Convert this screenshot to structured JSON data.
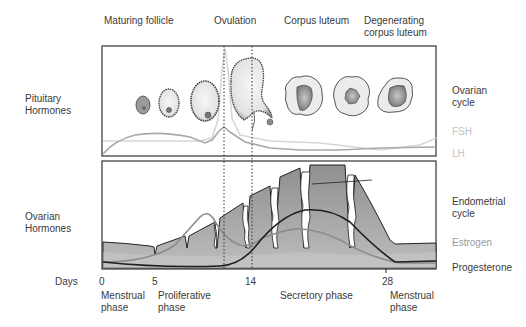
{
  "top_labels": {
    "maturing_follicle": "Maturing follicle",
    "ovulation": "Ovulation",
    "corpus_luteum": "Corpus luteum",
    "degenerating_line1": "Degenerating",
    "degenerating_line2": "corpus luteum"
  },
  "left_labels": {
    "pituitary_line1": "Pituitary",
    "pituitary_line2": "Hormones",
    "ovarian_line1": "Ovarian",
    "ovarian_line2": "Hormones",
    "days": "Days"
  },
  "right_labels": {
    "ovarian_cycle_line1": "Ovarian",
    "ovarian_cycle_line2": "cycle",
    "fsh": "FSH",
    "lh": "LH",
    "endometrial_line1": "Endometrial",
    "endometrial_line2": "cycle",
    "estrogen": "Estrogen",
    "progesterone": "Progesterone"
  },
  "annotation": {
    "uterine_line1": "Uterine",
    "uterine_line2": "gland"
  },
  "day_ticks": [
    "0",
    "5",
    "14",
    "28"
  ],
  "phases": {
    "menstrual_start_line1": "Menstrual",
    "menstrual_start_line2": "phase",
    "proliferative_line1": "Proliferative",
    "proliferative_line2": "phase",
    "secretory": "Secretory phase",
    "menstrual_end_line1": "Menstrual",
    "menstrual_end_line2": "phase"
  },
  "colors": {
    "border": "#333333",
    "fsh_line": "#a9a9a9",
    "lh_line": "#d6d6d6",
    "estrogen_line": "#8c8c8c",
    "progesterone_line": "#1e1e1e",
    "endometrium_fill": "#a8a8a8",
    "base_fill": "#cfcfcf"
  }
}
